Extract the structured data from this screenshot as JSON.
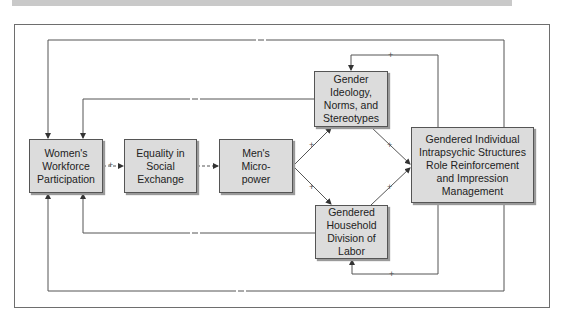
{
  "diagram": {
    "nodes": [
      {
        "id": "womens-workforce",
        "label": "Women's\nWorkforce\nParticipation"
      },
      {
        "id": "equality",
        "label": "Equality in\nSocial\nExchange"
      },
      {
        "id": "mens-micropower",
        "label": "Men's\nMicro-\npower"
      },
      {
        "id": "gender-ideology",
        "label": "Gender\nIdeology,\nNorms, and\nStereotypes"
      },
      {
        "id": "household-labor",
        "label": "Gendered\nHousehold\nDivision of\nLabor"
      },
      {
        "id": "intrapsychic",
        "label": "Gendered Individual\nIntrapsychic Structures\nRole Reinforcement\nand Impression\nManagement"
      }
    ],
    "edges": [
      {
        "from": "womens-workforce",
        "to": "equality",
        "sign": "+",
        "style": "dashed"
      },
      {
        "from": "equality",
        "to": "mens-micropower",
        "sign": "-",
        "style": "dashed"
      },
      {
        "from": "mens-micropower",
        "to": "gender-ideology",
        "sign": "+"
      },
      {
        "from": "mens-micropower",
        "to": "household-labor",
        "sign": "+"
      },
      {
        "from": "gender-ideology",
        "to": "intrapsychic",
        "sign": "+"
      },
      {
        "from": "household-labor",
        "to": "intrapsychic",
        "sign": "+"
      },
      {
        "from": "intrapsychic",
        "to": "gender-ideology",
        "sign": "+"
      },
      {
        "from": "intrapsychic",
        "to": "household-labor",
        "sign": "+"
      },
      {
        "from": "gender-ideology",
        "to": "womens-workforce",
        "sign": "-"
      },
      {
        "from": "household-labor",
        "to": "womens-workforce",
        "sign": "-"
      },
      {
        "from": "intrapsychic",
        "to": "womens-workforce",
        "sign": "-",
        "route": "top"
      },
      {
        "from": "intrapsychic",
        "to": "womens-workforce",
        "sign": "-",
        "route": "bottom"
      }
    ],
    "signs": {
      "plus": "+",
      "minus": "–"
    }
  }
}
